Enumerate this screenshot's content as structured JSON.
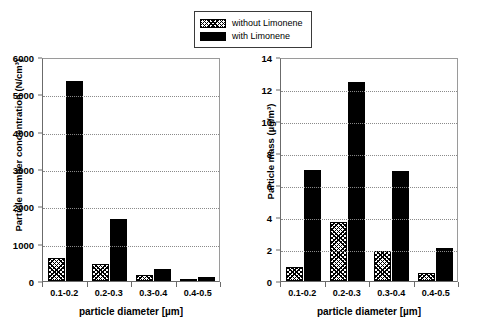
{
  "legend": {
    "position": "top-center",
    "entries": [
      {
        "label": "without Limonene",
        "style": "hatch"
      },
      {
        "label": "with Limonene",
        "style": "solid"
      }
    ]
  },
  "chart_data": [
    {
      "type": "bar",
      "id": "particle-number-concentration",
      "title": "",
      "xlabel": "particle diameter [µm]",
      "ylabel": "Particle number concentration (N/cm³)",
      "categories": [
        "0.1-0.2",
        "0.2-0.3",
        "0.3-0.4",
        "0.4-0.5"
      ],
      "series": [
        {
          "name": "without Limonene",
          "values": [
            620,
            460,
            150,
            50
          ]
        },
        {
          "name": "with Limonene",
          "values": [
            5360,
            1660,
            320,
            110
          ]
        }
      ],
      "ylim": [
        0,
        6000
      ],
      "yticks": [
        0,
        1000,
        2000,
        3000,
        4000,
        5000,
        6000
      ],
      "ytick_labels": [
        "0",
        "1000",
        "2000",
        "3000",
        "4000",
        "5000",
        "6000"
      ],
      "grid": true,
      "legend_position": "top-center"
    },
    {
      "type": "bar",
      "id": "particle-mass",
      "title": "",
      "xlabel": "particle diameter [µm]",
      "ylabel": "Particle mass (µg/m³)",
      "categories": [
        "0.1-0.2",
        "0.2-0.3",
        "0.3-0.4",
        "0.4-0.5"
      ],
      "series": [
        {
          "name": "without Limonene",
          "values": [
            0.85,
            3.7,
            1.85,
            0.5
          ]
        },
        {
          "name": "with Limonene",
          "values": [
            6.95,
            12.45,
            6.85,
            2.05
          ]
        }
      ],
      "ylim": [
        0,
        14
      ],
      "yticks": [
        0,
        2,
        4,
        6,
        8,
        10,
        12,
        14
      ],
      "ytick_labels": [
        "0",
        "2",
        "4",
        "6",
        "8",
        "10",
        "12",
        "14"
      ],
      "grid": true,
      "legend_position": "top-center"
    }
  ],
  "colors": {
    "series_with": "#000000",
    "series_without": "#ffffff",
    "axis": "#6b6b6b",
    "grid": "#8a8a8a",
    "background": "#ffffff"
  }
}
